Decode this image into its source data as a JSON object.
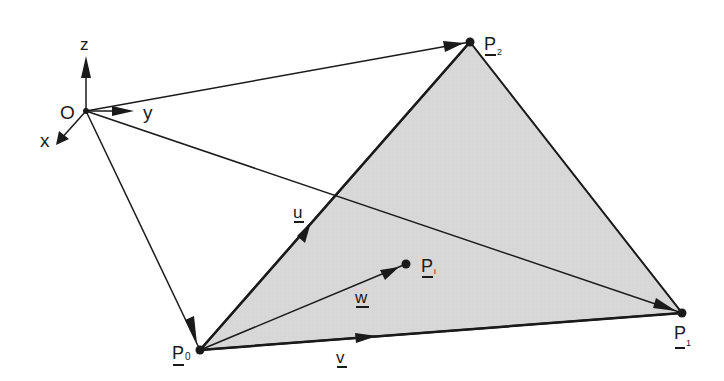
{
  "diagram": {
    "colors": {
      "line": "#1a1a1a",
      "triangle_fill": "#d6d6d6",
      "background": "#ffffff"
    },
    "origin": {
      "label": "O",
      "x": 86,
      "y": 111
    },
    "axes": {
      "x": {
        "label": "x"
      },
      "y": {
        "label": "y"
      },
      "z": {
        "label": "z"
      }
    },
    "points": {
      "p0": {
        "label": "P",
        "sub": "0",
        "x": 200,
        "y": 350
      },
      "p1": {
        "label": "P",
        "sub": "1",
        "x": 682,
        "y": 313
      },
      "p2": {
        "label": "P",
        "sub": "2",
        "x": 470,
        "y": 42
      },
      "pi": {
        "label": "P",
        "sub": "i",
        "x": 406,
        "y": 264
      }
    },
    "vectors": {
      "u": {
        "label": "u",
        "from": "p0",
        "to": "p2"
      },
      "v": {
        "label": "v",
        "from": "p0",
        "to": "p1"
      },
      "w": {
        "label": "w",
        "from": "p0",
        "to": "pi"
      }
    }
  }
}
